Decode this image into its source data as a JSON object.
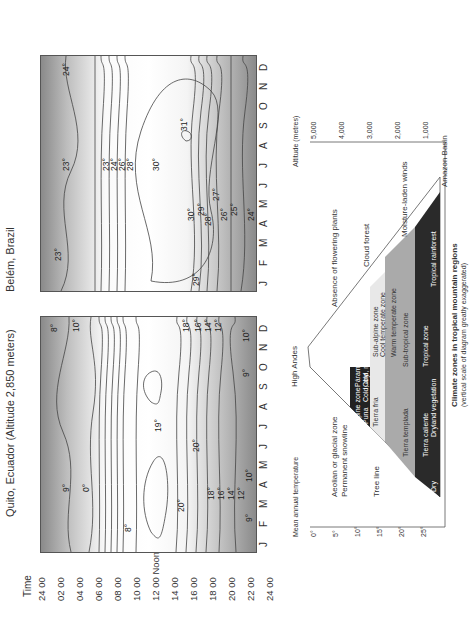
{
  "quito": {
    "title": "Quito, Ecuador (Altitude 2,850 meters)",
    "time_label": "Time",
    "times": [
      "24 00",
      "02 00",
      "04 00",
      "06 00",
      "08 00",
      "10 00",
      "12 00 Noon",
      "14 00",
      "16 00",
      "18 00",
      "20 00",
      "22 00",
      "24 00"
    ],
    "months": [
      "J",
      "F",
      "M",
      "A",
      "M",
      "J",
      "J",
      "A",
      "S",
      "O",
      "N",
      "D"
    ],
    "contour_labels": [
      "9°",
      "8°",
      "0°",
      "20°",
      "20°",
      "18°",
      "16°",
      "14°",
      "12°",
      "10°",
      "9°",
      "19°",
      "18°",
      "16°",
      "14°",
      "12°",
      "10°",
      "8°",
      "9°",
      "10°"
    ]
  },
  "belem": {
    "title": "Belém, Brazil",
    "months": [
      "J",
      "F",
      "M",
      "A",
      "M",
      "J",
      "J",
      "A",
      "S",
      "O",
      "N",
      "D"
    ],
    "contour_labels": [
      "23°",
      "29°",
      "23°",
      "24°",
      "26°",
      "28°",
      "30°",
      "30°",
      "29°",
      "28°",
      "27°",
      "26°",
      "25°",
      "24°",
      "31°",
      "24°",
      "23°"
    ]
  },
  "zones": {
    "caption_title": "Climate zones in tropical mountain regions",
    "caption_sub": "(vertical scale of diagram greatly exaggerated)",
    "temp_axis_label": "Mean annual temperature",
    "temp_ticks": [
      "0°",
      "5°",
      "10°",
      "15°",
      "20°",
      "25°"
    ],
    "alt_axis_label": "Altitude (metres)",
    "alt_ticks": [
      "5,000",
      "4,000",
      "3,000",
      "2,000",
      "1,000"
    ],
    "peak_label": "High Andes",
    "absence_label": "Absence of flowering plants",
    "aeolian_label": "Aeolian or glacial zone",
    "snowline_label": "Permanent snowline",
    "treeline_label": "Tree line",
    "cloud_forest_label": "Cloud forest",
    "winds_label": "Moisture-laden winds",
    "basin_label": "Amazon Basin",
    "alpine": "Alpine zone",
    "puna": "Puna",
    "puna_desc": "Cold, dry",
    "paramos": "Páramos",
    "paramos_desc": "Cold, moist",
    "subalpine": "Sub-alpine zone",
    "tierra_fria": "Tierra fria",
    "cool_temperate": "Cool temperate zone",
    "warm_temperate": "Warm temperate zone",
    "tierra_templada": "Tierra templada",
    "subtropical": "Sub-tropical zone",
    "tierra_caliente": "Tierra caliente",
    "tropical_zone": "Tropical zone",
    "dry_label": "Dry",
    "dry_veg": "Dryland vegetation",
    "tropical_rainforest": "Tropical rainforest"
  }
}
